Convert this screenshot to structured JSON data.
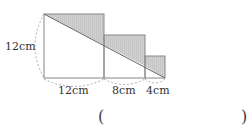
{
  "figure": {
    "squares_cm": [
      12,
      8,
      4
    ],
    "labels": {
      "height": "12cm",
      "side1": "12cm",
      "side2": "8cm",
      "side3": "4cm"
    },
    "shade_color": "#c8c8c8",
    "line_color": "#888888"
  },
  "answer": {
    "open": "(",
    "close": ")"
  }
}
